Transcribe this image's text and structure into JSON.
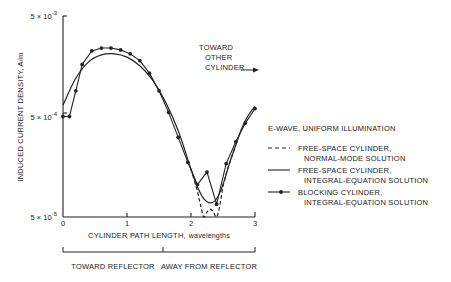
{
  "chart_data": {
    "type": "line",
    "title": "",
    "xlabel_caps": "CYLINDER PATH LENGTH,",
    "xlabel_unit": "wavelengths",
    "ylabel": "INDUCED CURRENT DENSITY, A/m",
    "yscale": "log",
    "ylim": [
      5e-05,
      0.005
    ],
    "xlim": [
      0,
      3
    ],
    "grid": false,
    "x_ticks": [
      "0",
      "1",
      "2",
      "3"
    ],
    "y_ticks": [
      {
        "value": 0.005,
        "base": "5 × 10",
        "exp": "-3"
      },
      {
        "value": 0.0005,
        "base": "5 × 10",
        "exp": "-4"
      },
      {
        "value": 5e-05,
        "base": "5 × 10",
        "exp": "-5"
      }
    ],
    "annotation": {
      "lines": [
        "TOWARD",
        "OTHER",
        "CYLINDER"
      ]
    },
    "regions": [
      {
        "label": "TOWARD REFLECTOR",
        "x_range": [
          0,
          1.55
        ]
      },
      {
        "label": "AWAY FROM REFLECTOR",
        "x_range": [
          1.55,
          3.0
        ]
      }
    ],
    "legend": {
      "title": "E-WAVE,  UNIFORM ILLUMINATION",
      "position": "right",
      "entries": [
        {
          "style": "dashed",
          "line1": "FREE-SPACE CYLINDER,",
          "line2": "NORMAL-MODE SOLUTION"
        },
        {
          "style": "solid",
          "line1": "FREE-SPACE CYLINDER,",
          "line2": "INTEGRAL-EQUATION SOLUTION"
        },
        {
          "style": "solid-dots",
          "line1": "BLOCKING CYLINDER,",
          "line2": "INTEGRAL-EQUATION SOLUTION"
        }
      ]
    },
    "series": [
      {
        "name": "Free-space cylinder, integral-equation solution",
        "style": "solid",
        "x": [
          0.0,
          0.2,
          0.4,
          0.6,
          0.8,
          1.0,
          1.2,
          1.4,
          1.6,
          1.8,
          2.0,
          2.1,
          2.2,
          2.3,
          2.4,
          2.5,
          2.6,
          2.7,
          2.8,
          2.9,
          3.0
        ],
        "y": [
          0.00065,
          0.0012,
          0.00175,
          0.00205,
          0.0021,
          0.00195,
          0.0016,
          0.00115,
          0.0007,
          0.00036,
          0.00015,
          0.0001,
          7.6e-05,
          6.9e-05,
          7.6e-05,
          0.000105,
          0.00017,
          0.00026,
          0.00039,
          0.00052,
          0.00063
        ]
      },
      {
        "name": "Free-space cylinder, normal-mode solution",
        "style": "dashed",
        "x": [
          2.0,
          2.1,
          2.15,
          2.2,
          2.25,
          2.3,
          2.35,
          2.4,
          2.45,
          2.5,
          2.55,
          2.6,
          2.7
        ],
        "y": [
          0.00015,
          9e-05,
          6.5e-05,
          5e-05,
          5.6e-05,
          6e-05,
          5.6e-05,
          5e-05,
          6.5e-05,
          0.0001,
          0.000135,
          0.00017,
          0.00026
        ]
      },
      {
        "name": "Blocking cylinder, integral-equation solution",
        "style": "solid-dots",
        "x": [
          0.0,
          0.1,
          0.2,
          0.3,
          0.45,
          0.6,
          0.75,
          0.9,
          1.05,
          1.2,
          1.35,
          1.5,
          1.65,
          1.8,
          1.95,
          2.1,
          2.25,
          2.4,
          2.55,
          2.7,
          2.85,
          3.0
        ],
        "y": [
          0.0005,
          0.0005,
          0.0009,
          0.00165,
          0.00225,
          0.0024,
          0.0024,
          0.0023,
          0.0021,
          0.0018,
          0.00135,
          0.0009,
          0.00055,
          0.00031,
          0.000175,
          0.000105,
          0.00014,
          6.7e-05,
          0.00017,
          0.00028,
          0.00043,
          0.0006
        ]
      }
    ]
  }
}
